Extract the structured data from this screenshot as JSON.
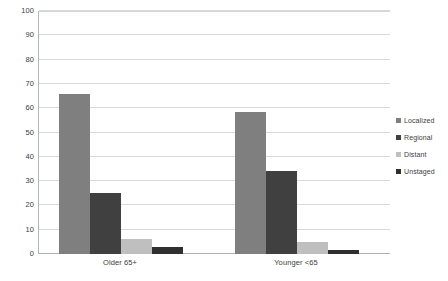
{
  "chart_data": {
    "type": "bar",
    "title": "",
    "subtitle": "",
    "xlabel": "",
    "ylabel": "",
    "categories": [
      "Older 65+",
      "Younger <65"
    ],
    "series": [
      {
        "name": "Localized",
        "values": [
          66,
          58.5
        ],
        "color": "#7f7f7f"
      },
      {
        "name": "Regional",
        "values": [
          25,
          34
        ],
        "color": "#404040"
      },
      {
        "name": "Distant",
        "values": [
          6,
          5
        ],
        "color": "#bfbfbf"
      },
      {
        "name": "Unstaged",
        "values": [
          3,
          1.5
        ],
        "color": "#2f2f2f"
      }
    ],
    "ylim": [
      0,
      100
    ],
    "y_ticks": [
      0,
      10,
      20,
      30,
      40,
      50,
      60,
      70,
      80,
      90,
      100
    ],
    "y_tick_labels": [
      "0",
      "10",
      "20",
      "30",
      "40",
      "50",
      "60",
      "70",
      "80",
      "90",
      "100"
    ],
    "grid": true,
    "grid_axis": "y",
    "legend": true,
    "legend_position": "right",
    "legend_entries": [
      "Localized",
      "Regional",
      "Distant",
      "Unstaged"
    ],
    "bar_mode": "grouped",
    "plot_background": "#ffffff",
    "gridline_color": "#d9d9d9",
    "axis_color": "#b0b0b0",
    "text_color": "#3c3c3c"
  }
}
